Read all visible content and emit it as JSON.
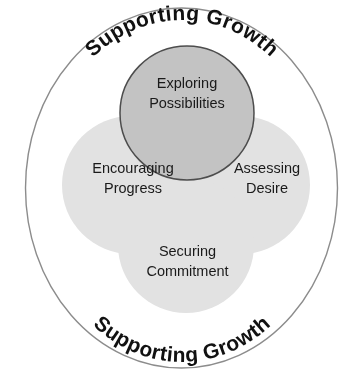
{
  "diagram": {
    "type": "venn-overlap-circles-in-ring",
    "outer_ring": {
      "top_label": "Supporting Growth",
      "bottom_label": "Supporting Growth",
      "stroke_color": "#8c8c8c"
    },
    "lobes": [
      {
        "id": "exploring",
        "line1": "Exploring",
        "line2": "Possibilities",
        "fill_color": "#c3c3c3",
        "stroke_color": "#4d4d4d",
        "position": "top"
      },
      {
        "id": "encouraging",
        "line1": "Encouraging",
        "line2": "Progress",
        "fill_color": "#dedede",
        "stroke_color": "none",
        "position": "left"
      },
      {
        "id": "assessing",
        "line1": "Assessing",
        "line2": "Desire",
        "fill_color": "#dedede",
        "stroke_color": "none",
        "position": "right"
      },
      {
        "id": "securing",
        "line1": "Securing",
        "line2": "Commitment",
        "fill_color": "#dedede",
        "stroke_color": "none",
        "position": "bottom"
      }
    ],
    "colors": {
      "background": "#ffffff",
      "text": "#1a1a1a",
      "arc_text": "#111111"
    }
  }
}
